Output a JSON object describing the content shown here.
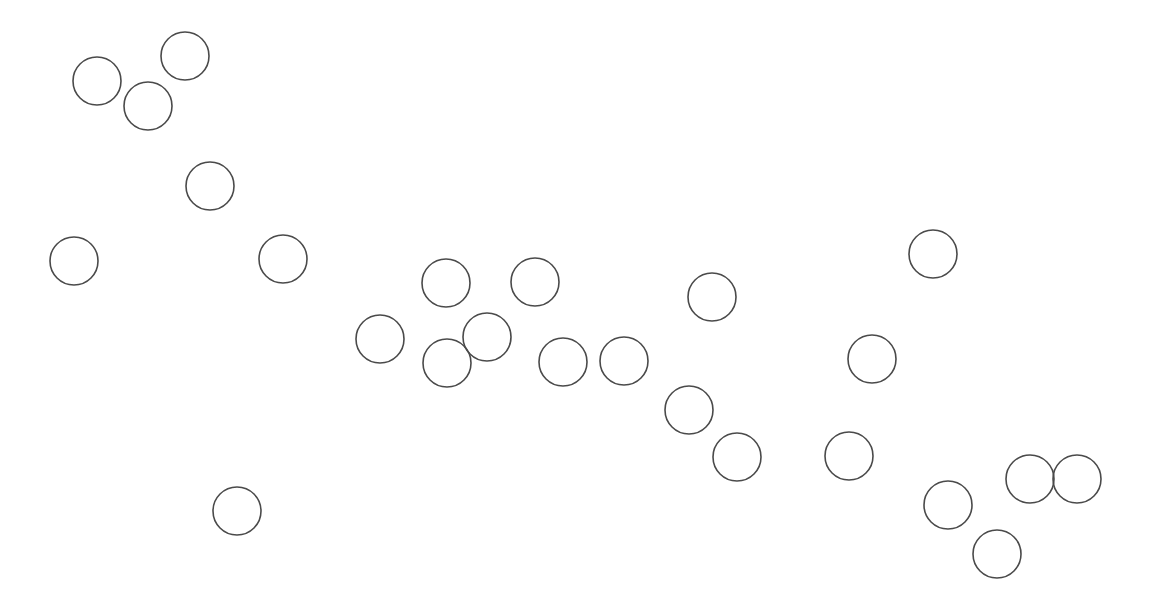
{
  "canvas": {
    "width": 1152,
    "height": 605,
    "background": "#ffffff"
  },
  "style": {
    "stroke": "#4a4a4a",
    "stroke_width": 1.6,
    "fill": "none",
    "radius": 24
  },
  "circles": [
    {
      "cx": 97,
      "cy": 81
    },
    {
      "cx": 148,
      "cy": 106
    },
    {
      "cx": 185,
      "cy": 56
    },
    {
      "cx": 210,
      "cy": 186
    },
    {
      "cx": 74,
      "cy": 261
    },
    {
      "cx": 283,
      "cy": 259
    },
    {
      "cx": 237,
      "cy": 511
    },
    {
      "cx": 380,
      "cy": 339
    },
    {
      "cx": 446,
      "cy": 283
    },
    {
      "cx": 535,
      "cy": 282
    },
    {
      "cx": 487,
      "cy": 337
    },
    {
      "cx": 447,
      "cy": 363
    },
    {
      "cx": 563,
      "cy": 362
    },
    {
      "cx": 624,
      "cy": 361
    },
    {
      "cx": 712,
      "cy": 297
    },
    {
      "cx": 933,
      "cy": 254
    },
    {
      "cx": 872,
      "cy": 359
    },
    {
      "cx": 689,
      "cy": 410
    },
    {
      "cx": 737,
      "cy": 457
    },
    {
      "cx": 849,
      "cy": 456
    },
    {
      "cx": 948,
      "cy": 505
    },
    {
      "cx": 1030,
      "cy": 479
    },
    {
      "cx": 1077,
      "cy": 479
    },
    {
      "cx": 997,
      "cy": 554
    }
  ]
}
